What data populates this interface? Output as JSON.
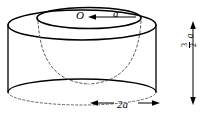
{
  "figure": {
    "background_color": "#ffffff",
    "line_color": "#000000",
    "labels": {
      "center_point": "O",
      "inner_radius": "a",
      "outer_diameter": "2a",
      "height_numerator": "3",
      "height_denominator": "2",
      "height_symbol": "a"
    },
    "annotations": {
      "radius_arrow": "arrow-pointing-left-to-O",
      "diameter_arrow": "double-headed-horizontal-arrow",
      "height_arrow": "double-headed-vertical-arrow"
    },
    "geometry": {
      "cylinder_top_ellipse": "solid",
      "cylinder_inner_ellipse": "solid",
      "cylinder_bottom_ellipse_front": "solid",
      "cylinder_bottom_ellipse_back": "dashed",
      "paraboloid_bowl": "dashed",
      "left_side_wall": "solid",
      "right_side_wall": "solid"
    }
  }
}
